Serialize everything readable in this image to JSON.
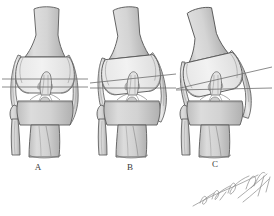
{
  "figure": {
    "type": "medical-illustration",
    "background_color": "#ffffff",
    "outline_color": "#555555",
    "bone_fill_color": "#d6d6d6",
    "cartilage_fill_color": "#ededed",
    "reference_line_color": "#6d6d6d",
    "label_color": "#3a3a3a",
    "panel_count": 3
  },
  "panels": [
    {
      "label": "A",
      "label_x": 38,
      "label_y": 167,
      "center_x": 45,
      "condition": "neutral alignment",
      "femoral_tilt_deg": 0,
      "tibial_tilt_deg": 0,
      "joint_gap_deg": 0,
      "femur_shaft_angle_deg": 0,
      "reference_lines": [
        {
          "name": "femoral-joint-line",
          "angle_deg": 0,
          "y": 79
        },
        {
          "name": "tibial-joint-line",
          "angle_deg": 0,
          "y": 87
        }
      ]
    },
    {
      "label": "B",
      "label_x": 130,
      "label_y": 167,
      "center_x": 132,
      "condition": "mild angulation",
      "femoral_tilt_deg": -6,
      "tibial_tilt_deg": 0,
      "joint_gap_deg": 6,
      "femur_shaft_angle_deg": -5,
      "reference_lines": [
        {
          "name": "femoral-joint-line",
          "angle_deg": -6,
          "y": 76
        },
        {
          "name": "tibial-joint-line",
          "angle_deg": 0,
          "y": 88
        }
      ]
    },
    {
      "label": "C",
      "label_x": 215,
      "label_y": 164,
      "center_x": 215,
      "condition": "severe angulation",
      "femoral_tilt_deg": -13,
      "tibial_tilt_deg": 0,
      "joint_gap_deg": 13,
      "femur_shaft_angle_deg": -13,
      "reference_lines": [
        {
          "name": "femoral-joint-line",
          "angle_deg": -13,
          "y": 70
        },
        {
          "name": "tibial-joint-line",
          "angle_deg": 0,
          "y": 88
        }
      ]
    }
  ],
  "anatomy": {
    "structures": [
      "femur-shaft",
      "medial-femoral-condyle",
      "lateral-femoral-condyle",
      "intercondylar-notch",
      "anterior-cruciate-ligament",
      "tibial-plateau",
      "tibial-spine",
      "tibia-shaft",
      "fibula-head",
      "fibula-shaft",
      "medial-collateral-ligament",
      "lateral-collateral-ligament"
    ]
  },
  "signature": {
    "present": true,
    "style": "cursive-artist-signature",
    "x": 192,
    "y": 186,
    "width": 78,
    "height": 28,
    "color": "#8a8a8a"
  }
}
